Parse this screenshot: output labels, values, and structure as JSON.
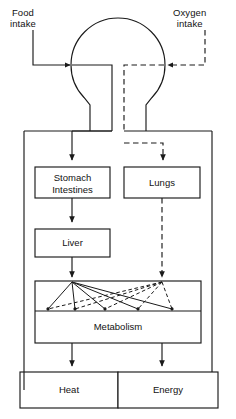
{
  "diagram": {
    "inputs": [
      {
        "id": "food",
        "label_line1": "Food",
        "label_line2": "intake",
        "style": "solid"
      },
      {
        "id": "oxygen",
        "label_line1": "Oxygen",
        "label_line2": "intake",
        "style": "dashed"
      }
    ],
    "nodes": [
      {
        "id": "body-circle",
        "label": ""
      },
      {
        "id": "stomach-intestines",
        "label_line1": "Stomach",
        "label_line2": "Intestines"
      },
      {
        "id": "lungs",
        "label": "Lungs"
      },
      {
        "id": "liver",
        "label": "Liver"
      },
      {
        "id": "metabolism",
        "label": "Metabolism"
      },
      {
        "id": "heat",
        "label": "Heat"
      },
      {
        "id": "energy",
        "label": "Energy"
      }
    ],
    "colors": {
      "stroke": "#1a1a1a",
      "background": "#ffffff",
      "text": "#121212"
    },
    "legend": {
      "solid_meaning": "food / nutrient pathway",
      "dashed_meaning": "oxygen / gas pathway"
    }
  }
}
